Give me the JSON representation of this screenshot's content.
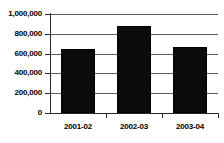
{
  "chart_data": {
    "type": "bar",
    "title": "",
    "subtitle": "",
    "xlabel": "",
    "ylabel": "",
    "categories": [
      "2001-02",
      "2002-03",
      "2003-04"
    ],
    "values": [
      650000,
      875000,
      670000
    ],
    "series": [
      {
        "name": "",
        "values": [
          650000,
          875000,
          670000
        ]
      }
    ],
    "ylim": [
      0,
      1000000
    ],
    "ytick_values": [
      0,
      200000,
      400000,
      600000,
      800000,
      1000000
    ],
    "ytick_labels": [
      "0",
      "200,000",
      "400,000",
      "600,000",
      "800,000",
      "1,000,000"
    ],
    "grid": true,
    "grid_axis": "y",
    "legend": false,
    "legend_position": "none",
    "annotations": [],
    "bar_color": "#0b0b0b",
    "gridline_color": "#5a5a5a",
    "axis_color": "#2b2b2b",
    "background_color": "#ffffff"
  }
}
